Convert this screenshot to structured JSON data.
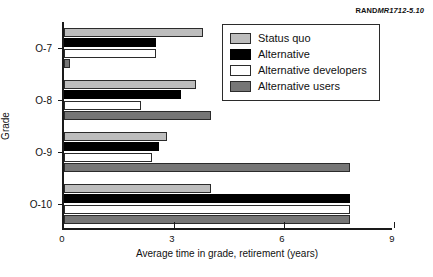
{
  "source_tag": {
    "rand": "RAND",
    "doc": "MR1712-5.10"
  },
  "chart_data": {
    "type": "bar",
    "orientation": "horizontal",
    "title": "",
    "xlabel": "Average time in grade, retirement (years)",
    "ylabel": "Grade",
    "categories": [
      "O-7",
      "O-8",
      "O-9",
      "O-10"
    ],
    "xlim": [
      0,
      9
    ],
    "xticks": [
      0,
      3,
      6,
      9
    ],
    "xtick_labels": [
      "0",
      "3",
      "6",
      "9"
    ],
    "grid": false,
    "legend_position": "upper right",
    "series": [
      {
        "name": "Status quo",
        "color": "#bdbdbd",
        "values": [
          3.8,
          3.6,
          2.8,
          4.0
        ]
      },
      {
        "name": "Alternative",
        "color": "#000000",
        "values": [
          2.5,
          3.2,
          2.6,
          7.8
        ]
      },
      {
        "name": "Alternative developers",
        "color": "#ffffff",
        "values": [
          2.5,
          2.1,
          2.4,
          7.8
        ]
      },
      {
        "name": "Alternative users",
        "color": "#767676",
        "values": [
          0.15,
          4.0,
          7.8,
          7.8
        ]
      }
    ]
  },
  "legend": {
    "items": [
      {
        "label": "Status quo",
        "key": "statusquo"
      },
      {
        "label": "Alternative",
        "key": "alternative"
      },
      {
        "label": "Alternative developers",
        "key": "altdev"
      },
      {
        "label": "Alternative users",
        "key": "altusers"
      }
    ]
  }
}
